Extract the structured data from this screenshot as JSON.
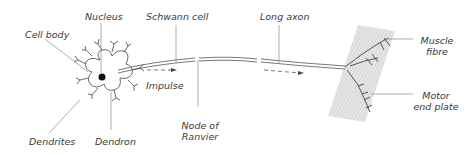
{
  "diagram": {
    "labels": {
      "nucleus": "Nucleus",
      "cell_body": "Cell body",
      "dendrites": "Dendrites",
      "dendron": "Dendron",
      "schwann_cell": "Schwann cell",
      "impulse": "Impulse",
      "node_of_ranvier_1": "Node of",
      "node_of_ranvier_2": "Ranvier",
      "long_axon": "Long axon",
      "muscle_fibre_1": "Muscle",
      "muscle_fibre_2": "fibre",
      "motor_end_plate_1": "Motor",
      "motor_end_plate_2": "end plate"
    },
    "colors": {
      "line": "#555555",
      "text": "#3a3a3a",
      "muscle_fill": "#d9d9d9"
    }
  }
}
